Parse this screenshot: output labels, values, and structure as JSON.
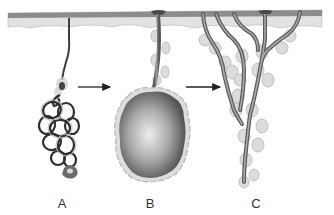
{
  "figure": {
    "type": "diagram",
    "stages": [
      {
        "id": "A",
        "label": "A",
        "form": "coiled tubular gland"
      },
      {
        "id": "B",
        "label": "B",
        "form": "saccular (globular) gland"
      },
      {
        "id": "C",
        "label": "C",
        "form": "branched tubular gland"
      }
    ],
    "arrows": [
      {
        "from": "A",
        "to": "B"
      },
      {
        "from": "B",
        "to": "C"
      }
    ],
    "colors": {
      "epidermis_top": "#8c8c8c",
      "epidermis_light": "#e2e2e2",
      "duct_dark": "#4a4a4a",
      "duct_light": "#a8a8a8",
      "cell_outline": "#b5b5b5",
      "cell_fill": "#dcdcdc",
      "sac_dark": "#555555",
      "sac_light": "#e9e9e9",
      "arrow": "#222222",
      "label": "#333333"
    }
  }
}
